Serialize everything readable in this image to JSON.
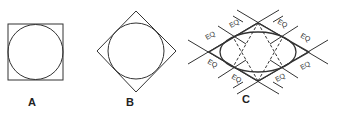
{
  "figures": [
    {
      "id": "A",
      "label": "A",
      "description": "circle inscribed in square"
    },
    {
      "id": "B",
      "label": "B",
      "description": "circle inscribed in rotated square (diamond)"
    },
    {
      "id": "C",
      "label": "C",
      "description": "ellipse inscribed in rhombus with equal-segment construction lines"
    }
  ],
  "figure_c": {
    "segment_labels": [
      "EQ",
      "EQ",
      "EQ",
      "EQ",
      "EQ",
      "EQ",
      "EQ",
      "EQ"
    ]
  },
  "colors": {
    "stroke": "#333333",
    "text": "#222222",
    "background": "#ffffff"
  }
}
